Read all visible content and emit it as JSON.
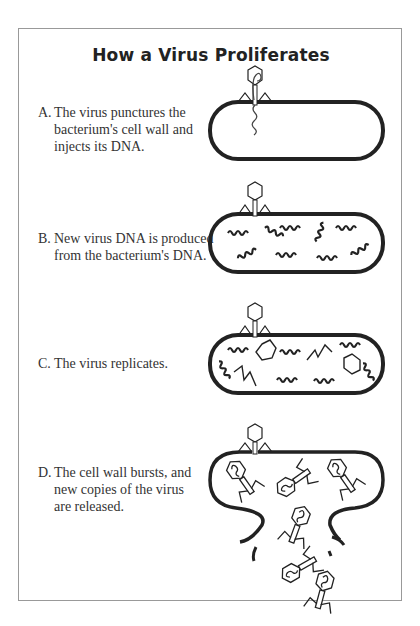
{
  "title": "How a Virus Proliferates",
  "steps": [
    {
      "label": "A.",
      "lines": [
        "The virus punctures the",
        "bacterium's cell wall and",
        "injects its DNA."
      ]
    },
    {
      "label": "B.",
      "lines": [
        "New virus DNA is produced",
        "from the bacterium's DNA."
      ]
    },
    {
      "label": "C.",
      "lines": [
        "The virus replicates."
      ]
    },
    {
      "label": "D.",
      "lines": [
        "The cell wall bursts, and",
        "new copies of the virus",
        "are released."
      ]
    }
  ],
  "colors": {
    "stroke": "#222222",
    "border": "#999999",
    "text": "#333333"
  }
}
